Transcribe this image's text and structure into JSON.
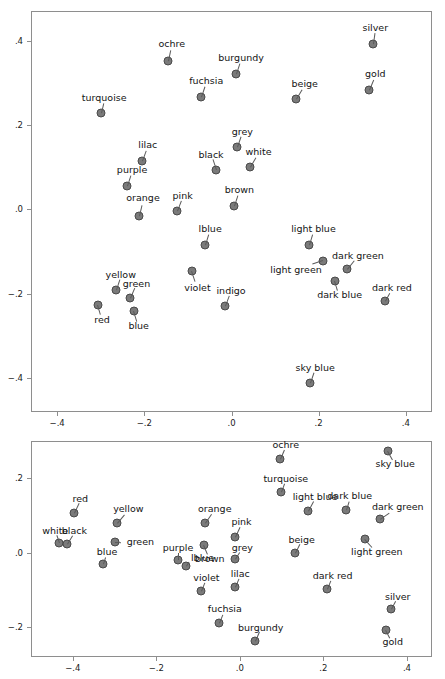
{
  "figure": {
    "background": "#ffffff",
    "point_fill": "#7a7a7a",
    "point_stroke": "#4a4a4a",
    "axis_color": "#8e8e8e"
  },
  "chart_data": [
    {
      "id": "top-panel",
      "type": "scatter",
      "title": "",
      "xlabel": "",
      "ylabel": "",
      "xlim": [
        -0.46,
        0.46
      ],
      "ylim": [
        -0.48,
        0.47
      ],
      "xticks": [
        -0.4,
        -0.2,
        0.0,
        0.2,
        0.4
      ],
      "xticklabels": [
        "−.4",
        "−.2",
        ".0",
        ".2",
        ".4"
      ],
      "yticks": [
        0.4,
        0.2,
        0.0,
        -0.2,
        -0.4
      ],
      "yticklabels": [
        ".4",
        ".2",
        ".0",
        "−.2",
        "−.4"
      ],
      "grid": false,
      "legend": "none",
      "points": [
        {
          "label": "silver",
          "x": 0.325,
          "y": 0.392,
          "lx": 0.33,
          "ly": 0.43,
          "anchor": "center"
        },
        {
          "label": "ochre",
          "x": -0.145,
          "y": 0.352,
          "lx": -0.137,
          "ly": 0.392,
          "anchor": "center"
        },
        {
          "label": "burgundy",
          "x": 0.01,
          "y": 0.32,
          "lx": 0.022,
          "ly": 0.358,
          "anchor": "center"
        },
        {
          "label": "gold",
          "x": 0.315,
          "y": 0.283,
          "lx": 0.33,
          "ly": 0.32,
          "anchor": "center"
        },
        {
          "label": "fuchsia",
          "x": -0.07,
          "y": 0.266,
          "lx": -0.058,
          "ly": 0.303,
          "anchor": "center"
        },
        {
          "label": "beige",
          "x": 0.147,
          "y": 0.262,
          "lx": 0.168,
          "ly": 0.298,
          "anchor": "center"
        },
        {
          "label": "turquoise",
          "x": -0.3,
          "y": 0.228,
          "lx": -0.292,
          "ly": 0.263,
          "anchor": "center"
        },
        {
          "label": "grey",
          "x": 0.013,
          "y": 0.148,
          "lx": 0.025,
          "ly": 0.184,
          "anchor": "center"
        },
        {
          "label": "lilac",
          "x": -0.205,
          "y": 0.115,
          "lx": -0.192,
          "ly": 0.152,
          "anchor": "center"
        },
        {
          "label": "white",
          "x": 0.042,
          "y": 0.101,
          "lx": 0.062,
          "ly": 0.137,
          "anchor": "center"
        },
        {
          "label": "black",
          "x": -0.035,
          "y": 0.093,
          "lx": -0.047,
          "ly": 0.13,
          "anchor": "center"
        },
        {
          "label": "purple",
          "x": -0.24,
          "y": 0.056,
          "lx": -0.228,
          "ly": 0.094,
          "anchor": "center"
        },
        {
          "label": "brown",
          "x": 0.006,
          "y": 0.008,
          "lx": 0.018,
          "ly": 0.046,
          "anchor": "center"
        },
        {
          "label": "pink",
          "x": -0.125,
          "y": -0.003,
          "lx": -0.112,
          "ly": 0.032,
          "anchor": "center"
        },
        {
          "label": "orange",
          "x": -0.213,
          "y": -0.016,
          "lx": -0.203,
          "ly": 0.028,
          "anchor": "center"
        },
        {
          "label": "lblue",
          "x": -0.06,
          "y": -0.084,
          "lx": -0.049,
          "ly": -0.047,
          "anchor": "center"
        },
        {
          "label": "light blue",
          "x": 0.177,
          "y": -0.085,
          "lx": 0.188,
          "ly": -0.047,
          "anchor": "center"
        },
        {
          "label": "light green",
          "x": 0.209,
          "y": -0.122,
          "lx": 0.148,
          "ly": -0.143,
          "anchor": "center"
        },
        {
          "label": "dark green",
          "x": 0.265,
          "y": -0.142,
          "lx": 0.29,
          "ly": -0.11,
          "anchor": "center"
        },
        {
          "label": "violet",
          "x": -0.091,
          "y": -0.146,
          "lx": -0.078,
          "ly": -0.186,
          "anchor": "center"
        },
        {
          "label": "dark blue",
          "x": 0.238,
          "y": -0.169,
          "lx": 0.248,
          "ly": -0.203,
          "anchor": "center"
        },
        {
          "label": "yellow",
          "x": -0.265,
          "y": -0.191,
          "lx": -0.254,
          "ly": -0.156,
          "anchor": "center"
        },
        {
          "label": "dark red",
          "x": 0.352,
          "y": -0.216,
          "lx": 0.368,
          "ly": -0.186,
          "anchor": "center"
        },
        {
          "label": "green",
          "x": -0.232,
          "y": -0.211,
          "lx": -0.218,
          "ly": -0.177,
          "anchor": "center"
        },
        {
          "label": "red",
          "x": -0.307,
          "y": -0.227,
          "lx": -0.297,
          "ly": -0.262,
          "anchor": "center"
        },
        {
          "label": "indigo",
          "x": -0.014,
          "y": -0.23,
          "lx": -0.001,
          "ly": -0.194,
          "anchor": "center"
        },
        {
          "label": "blue",
          "x": -0.224,
          "y": -0.24,
          "lx": -0.213,
          "ly": -0.277,
          "anchor": "center"
        },
        {
          "label": "sky blue",
          "x": 0.18,
          "y": -0.412,
          "lx": 0.192,
          "ly": -0.375,
          "anchor": "center"
        }
      ]
    },
    {
      "id": "bottom-panel",
      "type": "scatter",
      "title": "",
      "xlabel": "",
      "ylabel": "",
      "xlim": [
        -0.5,
        0.46
      ],
      "ylim": [
        -0.28,
        0.3
      ],
      "xticks": [
        -0.4,
        -0.2,
        0.0,
        0.2,
        0.4
      ],
      "xticklabels": [
        "−.4",
        "−.2",
        ".0",
        ".2",
        ".4"
      ],
      "yticks": [
        0.2,
        0.0,
        -0.2
      ],
      "yticklabels": [
        ".2",
        ".0",
        "−.2"
      ],
      "grid": false,
      "legend": "none",
      "points": [
        {
          "label": "sky blue",
          "x": 0.355,
          "y": 0.272,
          "lx": 0.372,
          "ly": 0.238,
          "anchor": "center"
        },
        {
          "label": "ochre",
          "x": 0.096,
          "y": 0.252,
          "lx": 0.11,
          "ly": 0.288,
          "anchor": "center"
        },
        {
          "label": "turquoise",
          "x": 0.098,
          "y": 0.162,
          "lx": 0.11,
          "ly": 0.198,
          "anchor": "center"
        },
        {
          "label": "dark blue",
          "x": 0.253,
          "y": 0.116,
          "lx": 0.263,
          "ly": 0.152,
          "anchor": "center"
        },
        {
          "label": "light blue",
          "x": 0.162,
          "y": 0.112,
          "lx": 0.18,
          "ly": 0.15,
          "anchor": "center"
        },
        {
          "label": "red",
          "x": -0.398,
          "y": 0.106,
          "lx": -0.382,
          "ly": 0.144,
          "anchor": "center"
        },
        {
          "label": "dark green",
          "x": 0.335,
          "y": 0.09,
          "lx": 0.378,
          "ly": 0.124,
          "anchor": "center"
        },
        {
          "label": "yellow",
          "x": -0.295,
          "y": 0.081,
          "lx": -0.267,
          "ly": 0.118,
          "anchor": "center"
        },
        {
          "label": "orange",
          "x": -0.083,
          "y": 0.079,
          "lx": -0.06,
          "ly": 0.117,
          "anchor": "center"
        },
        {
          "label": "pink",
          "x": -0.012,
          "y": 0.043,
          "lx": 0.004,
          "ly": 0.082,
          "anchor": "center"
        },
        {
          "label": "light green",
          "x": 0.3,
          "y": 0.037,
          "lx": 0.328,
          "ly": 0.002,
          "anchor": "center"
        },
        {
          "label": "green",
          "x": -0.298,
          "y": 0.03,
          "lx": -0.271,
          "ly": 0.029,
          "anchor": "left"
        },
        {
          "label": "white",
          "x": -0.432,
          "y": 0.027,
          "lx": -0.442,
          "ly": 0.059,
          "anchor": "center"
        },
        {
          "label": "black",
          "x": -0.415,
          "y": 0.024,
          "lx": -0.396,
          "ly": 0.059,
          "anchor": "center"
        },
        {
          "label": "brown",
          "x": -0.086,
          "y": 0.021,
          "lx": -0.072,
          "ly": -0.016,
          "anchor": "center"
        },
        {
          "label": "beige",
          "x": 0.132,
          "y": -0.002,
          "lx": 0.148,
          "ly": 0.034,
          "anchor": "center"
        },
        {
          "label": "grey",
          "x": -0.011,
          "y": -0.018,
          "lx": 0.006,
          "ly": 0.012,
          "anchor": "center"
        },
        {
          "label": "purple",
          "x": -0.148,
          "y": -0.019,
          "lx": -0.148,
          "ly": 0.012,
          "anchor": "center"
        },
        {
          "label": "lblue",
          "x": -0.13,
          "y": -0.036,
          "lx": -0.117,
          "ly": -0.013,
          "anchor": "left"
        },
        {
          "label": "blue",
          "x": -0.327,
          "y": -0.03,
          "lx": -0.318,
          "ly": 0.002,
          "anchor": "center"
        },
        {
          "label": "lilac",
          "x": -0.012,
          "y": -0.092,
          "lx": 0.001,
          "ly": -0.058,
          "anchor": "center"
        },
        {
          "label": "dark red",
          "x": 0.209,
          "y": -0.098,
          "lx": 0.222,
          "ly": -0.062,
          "anchor": "center"
        },
        {
          "label": "violet",
          "x": -0.093,
          "y": -0.104,
          "lx": -0.08,
          "ly": -0.068,
          "anchor": "center"
        },
        {
          "label": "silver",
          "x": 0.362,
          "y": -0.152,
          "lx": 0.378,
          "ly": -0.118,
          "anchor": "center"
        },
        {
          "label": "fuchsia",
          "x": -0.049,
          "y": -0.188,
          "lx": -0.036,
          "ly": -0.152,
          "anchor": "center"
        },
        {
          "label": "gold",
          "x": 0.35,
          "y": -0.207,
          "lx": 0.366,
          "ly": -0.241,
          "anchor": "center"
        },
        {
          "label": "burgundy",
          "x": 0.036,
          "y": -0.238,
          "lx": 0.05,
          "ly": -0.202,
          "anchor": "center"
        }
      ]
    }
  ]
}
